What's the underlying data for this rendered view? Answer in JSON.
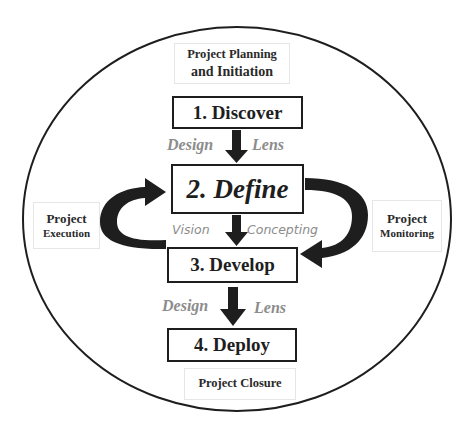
{
  "diagram": {
    "outer_circle_label": "",
    "phases": {
      "top": {
        "line1": "Project Planning",
        "line2": "and Initiation"
      },
      "left": {
        "line1": "Project",
        "line2": "Execution"
      },
      "right": {
        "line1": "Project",
        "line2": "Monitoring"
      },
      "bottom": {
        "line1": "Project Closure"
      }
    },
    "stages": [
      {
        "label": "1. Discover"
      },
      {
        "label": "2. Define"
      },
      {
        "label": "3. Develop"
      },
      {
        "label": "4. Deploy"
      }
    ],
    "connectors": [
      {
        "left": "Design",
        "right": "Lens"
      },
      {
        "left": "Vision",
        "right": "Concepting"
      },
      {
        "left": "Design",
        "right": "Lens"
      }
    ],
    "colors": {
      "stroke": "#1e1e1e",
      "lens_text": "#8c8c8c",
      "background": "#ffffff"
    }
  }
}
